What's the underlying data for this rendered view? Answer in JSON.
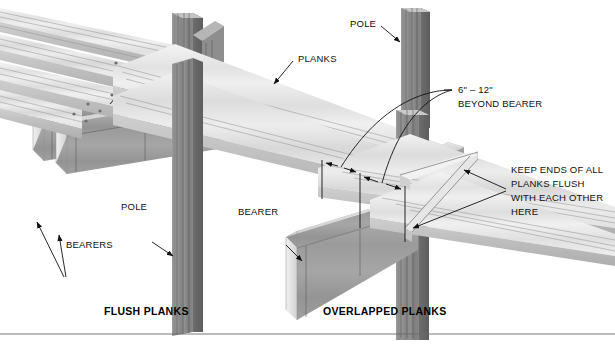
{
  "figure": {
    "type": "technical-illustration"
  },
  "labels": {
    "planks": "PLANKS",
    "pole_top": "POLE",
    "pole_bottom": "POLE",
    "bearers": "BEARERS",
    "bearer": "BEARER",
    "dimension_line1": "6\" – 12\"",
    "dimension_line2": "BEYOND BEARER",
    "note_line1": "KEEP ENDS OF ALL",
    "note_line2": "PLANKS FLUSH",
    "note_line3": "WITH EACH OTHER",
    "note_line4": "HERE"
  },
  "captions": {
    "left": "FLUSH PLANKS",
    "right": "OVERLAPPED PLANKS"
  },
  "colors": {
    "background": "#ffffff",
    "text": "#111111",
    "plank_light": "#ececec",
    "plank_mid": "#d6d6d6",
    "plank_shadow": "#b4b4b4",
    "pole_dark": "#8a8a8a",
    "pole_darker": "#6f6f6f",
    "bearer_dark": "#9a9a9a",
    "leader": "#111111",
    "rule": "#6b6b6b"
  }
}
